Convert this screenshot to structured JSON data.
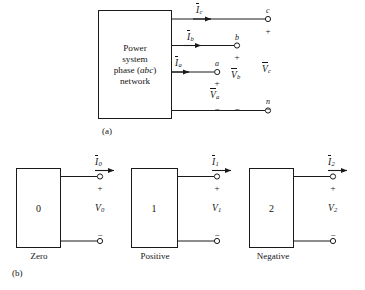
{
  "figure": {
    "caption_a": "(a)",
    "caption_b": "(b)"
  },
  "part_a": {
    "box_lines": [
      "Power",
      "system",
      "phase (abc)",
      "network"
    ],
    "box_italic_word": "abc",
    "currents": [
      {
        "name": "current-c",
        "base": "I",
        "sub": "c",
        "overbar": true
      },
      {
        "name": "current-b",
        "base": "I",
        "sub": "b",
        "overbar": true
      },
      {
        "name": "current-a",
        "base": "I",
        "sub": "a",
        "overbar": true
      }
    ],
    "terminals": [
      {
        "name": "terminal-c",
        "label": "c"
      },
      {
        "name": "terminal-b",
        "label": "b"
      },
      {
        "name": "terminal-a",
        "label": "a"
      },
      {
        "name": "terminal-n",
        "label": "n"
      }
    ],
    "voltages": [
      {
        "name": "voltage-a",
        "base": "V",
        "sub": "a",
        "overbar": true
      },
      {
        "name": "voltage-b",
        "base": "V",
        "sub": "b",
        "overbar": true
      },
      {
        "name": "voltage-c",
        "base": "V",
        "sub": "c",
        "overbar": true
      }
    ],
    "polarity_plus": "+",
    "polarity_minus": "−"
  },
  "part_b": {
    "networks": [
      {
        "name": "zero-sequence",
        "box_number": "0",
        "caption": "Zero",
        "current": {
          "base": "I",
          "sub": "0",
          "overbar": true
        },
        "voltage": {
          "base": "V",
          "sub": "0",
          "overbar": false
        },
        "plus": "+",
        "minus": "−"
      },
      {
        "name": "positive-sequence",
        "box_number": "1",
        "caption": "Positive",
        "current": {
          "base": "I",
          "sub": "1",
          "overbar": true
        },
        "voltage": {
          "base": "V",
          "sub": "1",
          "overbar": false
        },
        "plus": "+",
        "minus": "−"
      },
      {
        "name": "negative-sequence",
        "box_number": "2",
        "caption": "Negative",
        "current": {
          "base": "I",
          "sub": "2",
          "overbar": true
        },
        "voltage": {
          "base": "V",
          "sub": "2",
          "overbar": false
        },
        "plus": "+",
        "minus": "−"
      }
    ]
  },
  "style": {
    "line_color": "#1a1a1a",
    "background": "#ffffff",
    "text_color": "#141414"
  }
}
